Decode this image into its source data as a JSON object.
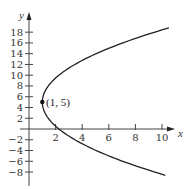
{
  "chart_data": {
    "type": "line",
    "title": "",
    "xlabel": "x",
    "ylabel": "y",
    "xlim": [
      0,
      10.6
    ],
    "ylim": [
      -9,
      19
    ],
    "x_ticks": [
      2,
      4,
      6,
      8,
      10
    ],
    "y_ticks": [
      -8,
      -6,
      -4,
      -2,
      2,
      4,
      6,
      8,
      10,
      12,
      14,
      16,
      18
    ],
    "grid": false,
    "legend": null,
    "series": [
      {
        "name": "parabola x = 1 + (y - 5)^2 / 20",
        "equation": "x = 1 + (y-5)^2/20",
        "y_range": [
          -8.6,
          18.8
        ],
        "points": [
          {
            "x": 10.25,
            "y": -8.6
          },
          {
            "x": 5.05,
            "y": -4
          },
          {
            "x": 2.25,
            "y": 0
          },
          {
            "x": 1.0,
            "y": 5
          },
          {
            "x": 2.25,
            "y": 10
          },
          {
            "x": 5.05,
            "y": 14
          },
          {
            "x": 10.52,
            "y": 18.8
          }
        ]
      }
    ],
    "annotations": [
      {
        "text": "(1, 5)",
        "x": 1,
        "y": 5,
        "marker": "point"
      }
    ]
  },
  "labels": {
    "x_axis": "x",
    "y_axis": "y",
    "vertex": "(1, 5)",
    "x_ticks": [
      "2",
      "4",
      "6",
      "8",
      "10"
    ],
    "y_ticks": [
      "18",
      "16",
      "14",
      "12",
      "10",
      "8",
      "6",
      "4",
      "2",
      "−2",
      "−4",
      "−6",
      "−8"
    ]
  }
}
